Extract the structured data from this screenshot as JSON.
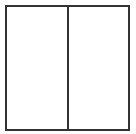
{
  "diagram": {
    "type": "two-panel-box",
    "panels": [
      {
        "id": "left",
        "label": ""
      },
      {
        "id": "right",
        "label": ""
      }
    ],
    "colors": {
      "border": "#333333",
      "background": "#ffffff"
    }
  }
}
